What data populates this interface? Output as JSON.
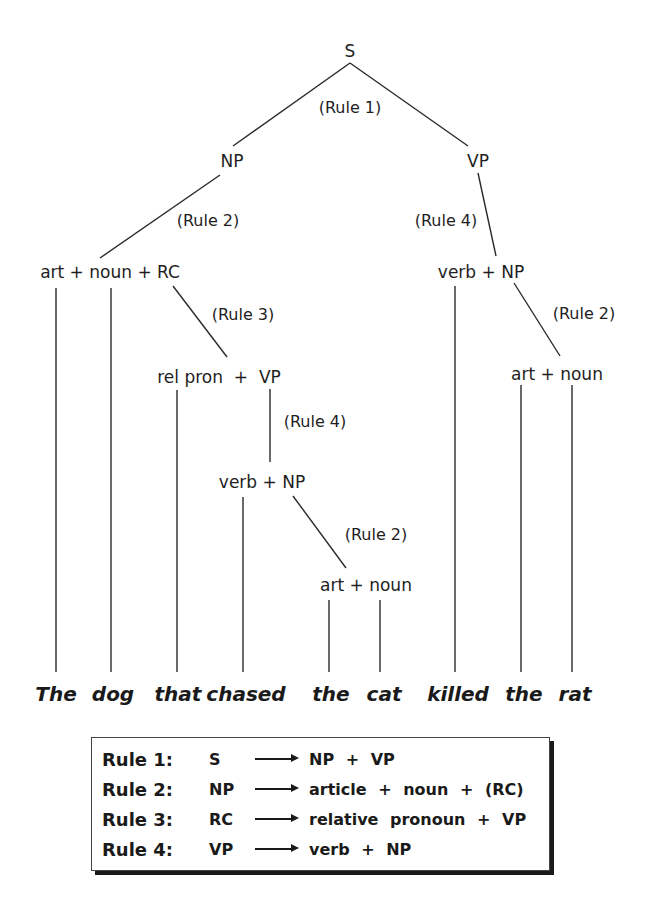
{
  "tree": {
    "nodes": {
      "s": "S",
      "np_top": "NP",
      "vp_top": "VP",
      "np_expansion": "art + noun + RC",
      "vp_expansion": "verb + NP",
      "rc_expansion": "rel pron  +  VP",
      "np_right_expansion": "art + noun",
      "vp_inner_expansion": "verb + NP",
      "np_inner_expansion": "art + noun"
    },
    "rule_labels": {
      "s_rule": "(Rule 1)",
      "np_top_rule": "(Rule 2)",
      "vp_top_rule": "(Rule 4)",
      "rc_rule": "(Rule 3)",
      "np_right_rule": "(Rule 2)",
      "vp_inner_rule": "(Rule 4)",
      "np_inner_rule": "(Rule 2)"
    },
    "words": [
      "The",
      "dog",
      "that",
      "chased",
      "the",
      "cat",
      "killed",
      "the",
      "rat"
    ]
  },
  "rules": [
    {
      "name": "Rule 1:",
      "lhs": "S",
      "rhs": "NP + VP"
    },
    {
      "name": "Rule 2:",
      "lhs": "NP",
      "rhs": "article + noun + (RC)"
    },
    {
      "name": "Rule 3:",
      "lhs": "RC",
      "rhs": "relative pronoun + VP"
    },
    {
      "name": "Rule 4:",
      "lhs": "VP",
      "rhs": "verb + NP"
    }
  ]
}
